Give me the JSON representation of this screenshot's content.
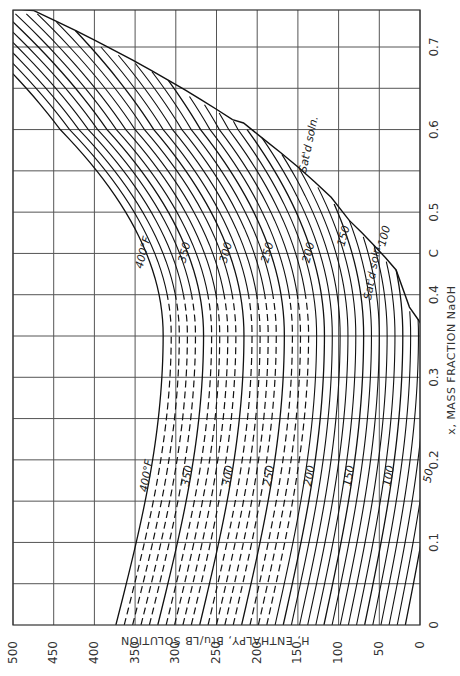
{
  "chart_data": {
    "type": "line",
    "title": "",
    "orientation": "rotated 90 degrees (H axis horizontal, reversed; x axis vertical)",
    "xlabel": "x, MASS FRACTION NaOH",
    "ylabel": "H, ENTHALPY, Btu/LB SOLUTION",
    "x_ticks": [
      "0",
      "0.1",
      "0.2",
      "0.3",
      "0.4",
      "C",
      "0.5",
      "0.6",
      "0.7"
    ],
    "x_tick_values": [
      0,
      0.1,
      0.2,
      0.3,
      0.4,
      0.45,
      0.5,
      0.6,
      0.7
    ],
    "y_ticks": [
      "500",
      "450",
      "400",
      "350",
      "300",
      "250",
      "200",
      "150",
      "100",
      "50",
      "0"
    ],
    "y_tick_values": [
      500,
      450,
      400,
      350,
      300,
      250,
      200,
      150,
      100,
      50,
      0
    ],
    "xlim": [
      0,
      0.745
    ],
    "ylim": [
      0,
      500
    ],
    "grid": true,
    "annotations": [
      "400°F",
      "350",
      "300",
      "250",
      "200",
      "150",
      "100",
      "50",
      "Sat'd soln.",
      "Sat'd soln."
    ],
    "series_note": "Isotherms every 10°F from 50°F to 400°F; dashed segments for T > 210°F at x < 0.4",
    "series": [
      {
        "name": "400°F",
        "x": [
          0,
          0.1,
          0.2,
          0.3,
          0.4,
          0.5,
          0.6,
          0.7
        ],
        "H": [
          372,
          352,
          343,
          340,
          338,
          334,
          355,
          400
        ]
      },
      {
        "name": "350°F",
        "x": [
          0,
          0.1,
          0.2,
          0.3,
          0.4,
          0.5,
          0.6,
          0.7
        ],
        "H": [
          320,
          300,
          292,
          289,
          288,
          290,
          310,
          355
        ]
      },
      {
        "name": "300°F",
        "x": [
          0,
          0.1,
          0.2,
          0.3,
          0.4,
          0.5,
          0.6,
          0.7
        ],
        "H": [
          268,
          250,
          242,
          239,
          240,
          245,
          268,
          310
        ]
      },
      {
        "name": "250°F",
        "x": [
          0,
          0.1,
          0.2,
          0.3,
          0.4,
          0.5,
          0.6,
          0.7
        ],
        "H": [
          218,
          198,
          190,
          188,
          190,
          200,
          225,
          268
        ]
      },
      {
        "name": "200°F",
        "x": [
          0,
          0.1,
          0.2,
          0.3,
          0.4,
          0.5,
          0.6
        ],
        "H": [
          168,
          148,
          140,
          140,
          144,
          158,
          188
        ]
      },
      {
        "name": "150°F",
        "x": [
          0,
          0.1,
          0.2,
          0.3,
          0.4,
          0.5
        ],
        "H": [
          118,
          100,
          92,
          92,
          100,
          118
        ]
      },
      {
        "name": "100°F",
        "x": [
          0,
          0.1,
          0.2,
          0.3,
          0.4,
          0.45
        ],
        "H": [
          68,
          52,
          45,
          48,
          60,
          75
        ]
      },
      {
        "name": "50°F",
        "x": [
          0,
          0.1,
          0.2,
          0.3
        ],
        "H": [
          18,
          8,
          3,
          5
        ]
      }
    ]
  },
  "labels": {
    "xlabel": "x, MASS FRACTION NaOH",
    "ylabel": "H, ENTHALPY, Btu/LB SOLUTION",
    "satd_upper": "Sat'd soln.",
    "satd_lower": "Sat'd soln.",
    "top_labels": [
      "400°F",
      "350",
      "300",
      "250",
      "200",
      "150",
      "100"
    ],
    "bottom_labels": [
      "400°F",
      "350",
      "300",
      "250",
      "200",
      "150",
      "100",
      "50"
    ],
    "zero_x": "0",
    "zero_h": "0"
  },
  "geometry": {
    "plot_left": 13,
    "plot_right": 420,
    "plot_top": 10,
    "plot_bottom": 625,
    "h_max": 500,
    "x_max": 0.745
  }
}
